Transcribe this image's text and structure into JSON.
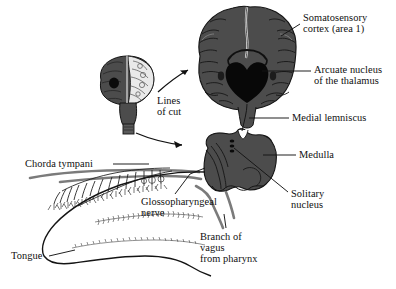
{
  "figure": {
    "background_color": "#ffffff",
    "width": 396,
    "height": 289
  },
  "palette": {
    "brain_gray": "#4c4c4c",
    "brain_gray_dark": "#3f3f3f",
    "thalamus_black": "#0b0b0b",
    "outline": "#111111",
    "nerve_gray": "#7b7b7b",
    "text": "#101010",
    "inset_light": "#e8e8e8"
  },
  "labels": [
    {
      "id": "somatosensory-cortex",
      "lines": [
        "Somatosensory",
        "cortex (area 1)"
      ],
      "x": 303,
      "y": 12
    },
    {
      "id": "arcuate-nucleus",
      "lines": [
        "Arcuate nucleus",
        "of the thalamus"
      ],
      "x": 314,
      "y": 64
    },
    {
      "id": "medial-lemniscus",
      "lines": [
        "Medial lemniscus"
      ],
      "x": 292,
      "y": 113
    },
    {
      "id": "medulla",
      "lines": [
        "Medulla"
      ],
      "x": 299,
      "y": 150
    },
    {
      "id": "solitary-nucleus",
      "lines": [
        "Solitary",
        "nucleus"
      ],
      "x": 291,
      "y": 190
    },
    {
      "id": "branch-of-vagus",
      "lines": [
        "Branch of",
        "vagus",
        "from pharynx"
      ],
      "x": 200,
      "y": 232
    },
    {
      "id": "glossopharyngeal-nerve",
      "lines": [
        "Glossopharyngeal",
        "nerve"
      ],
      "x": 141,
      "y": 197
    },
    {
      "id": "chorda-tympani",
      "lines": [
        "Chorda tympani"
      ],
      "x": 25,
      "y": 160
    },
    {
      "id": "tongue",
      "lines": [
        "Tongue"
      ],
      "x": 11,
      "y": 253
    },
    {
      "id": "lines-of-cut",
      "lines": [
        "Lines",
        "of cut"
      ],
      "x": 157,
      "y": 96
    }
  ],
  "structures": [
    {
      "id": "coronal-brain-section",
      "name": "Coronal brain section",
      "fill": "#4c4c4c"
    },
    {
      "id": "thalamus",
      "name": "Arcuate nucleus of the thalamus",
      "fill": "#0b0b0b"
    },
    {
      "id": "medulla-section",
      "name": "Medulla cross section",
      "fill": "#4c4c4c"
    },
    {
      "id": "whole-brain-inset",
      "name": "Whole brain inset with cut lines",
      "fill": "#4c4c4c"
    },
    {
      "id": "tongue-outline",
      "name": "Tongue with taste bud innervation",
      "fill": "#ffffff"
    },
    {
      "id": "nerve-bundle",
      "name": "Cranial nerve bundle",
      "fill": "#7b7b7b"
    }
  ]
}
